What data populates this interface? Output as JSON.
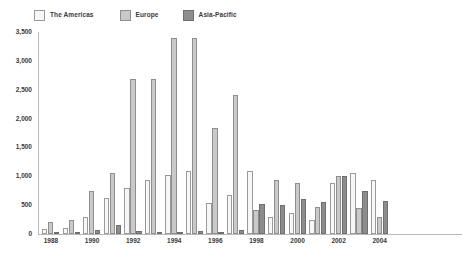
{
  "legend": {
    "entries": [
      {
        "label": "The Americas",
        "color": "#f7f7f7",
        "border": "#9a9a9a"
      },
      {
        "label": "Europe",
        "color": "#c9c9c9",
        "border": "#8e8e8e"
      },
      {
        "label": "Asia-Pacific",
        "color": "#8d8d8d",
        "border": "#6f6f6f"
      }
    ]
  },
  "axes": {
    "y_ticks": [
      "0",
      "500",
      "1,000",
      "1,500",
      "2,000",
      "2,500",
      "3,000",
      "3,500"
    ],
    "x_ticks": [
      "1988",
      "1990",
      "1992",
      "1994",
      "1996",
      "1998",
      "2000",
      "2002",
      "2004"
    ]
  },
  "chart_data": {
    "type": "bar",
    "title": "",
    "subtitle": "",
    "xlabel": "",
    "ylabel": "",
    "ylim": [
      0,
      3500
    ],
    "ytick_step": 500,
    "grid": false,
    "legend_position": "top-left",
    "categories": [
      "1988",
      "1989",
      "1990",
      "1991",
      "1992",
      "1993",
      "1994",
      "1995",
      "1996",
      "1997",
      "1998",
      "1999",
      "2000",
      "2001",
      "2002",
      "2003",
      "2004"
    ],
    "series": [
      {
        "name": "The Americas",
        "color": "#f7f7f7",
        "border": "#9a9a9a",
        "values": [
          90,
          110,
          290,
          620,
          790,
          930,
          1020,
          1090,
          530,
          680,
          1090,
          290,
          360,
          240,
          880,
          1060,
          930
        ]
      },
      {
        "name": "Europe",
        "color": "#c9c9c9",
        "border": "#8e8e8e",
        "values": [
          210,
          240,
          750,
          1060,
          2680,
          2690,
          3390,
          3400,
          1830,
          2410,
          410,
          930,
          880,
          470,
          1000,
          450,
          300
        ]
      },
      {
        "name": "Asia-Pacific",
        "color": "#8d8d8d",
        "border": "#6f6f6f",
        "values": [
          40,
          40,
          70,
          150,
          50,
          40,
          40,
          60,
          40,
          70,
          520,
          500,
          600,
          560,
          1000,
          740,
          580
        ]
      }
    ]
  }
}
